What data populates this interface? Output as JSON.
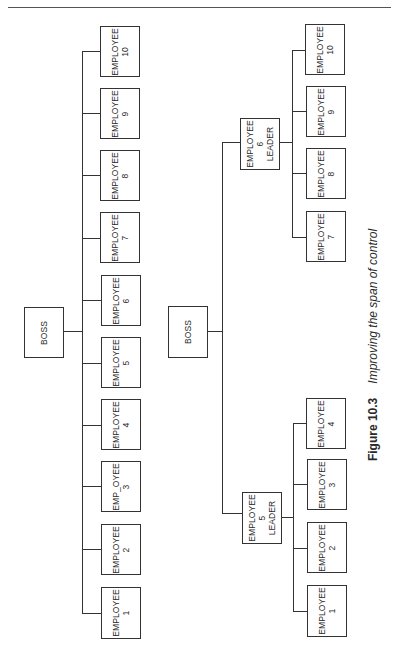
{
  "header": {
    "rule": true
  },
  "left_chart": {
    "name": "Flat structure",
    "boss": {
      "label": "BOSS"
    },
    "employees": [
      {
        "line1": "EMPLOYEE",
        "line2": "1"
      },
      {
        "line1": "EMPLOYEE",
        "line2": "2"
      },
      {
        "line1": "EMP_OYEE",
        "line2": "3"
      },
      {
        "line1": "EMPLOYEE",
        "line2": "4"
      },
      {
        "line1": "EMPLOYEE",
        "line2": "5"
      },
      {
        "line1": "EMPLOYEE",
        "line2": "6"
      },
      {
        "line1": "EMPLOYEE",
        "line2": "7"
      },
      {
        "line1": "EMPLOYEE",
        "line2": "8"
      },
      {
        "line1": "EMPLOYEE",
        "line2": "9"
      },
      {
        "line1": "EMPLOYEE",
        "line2": "10"
      }
    ]
  },
  "right_chart": {
    "name": "Structure with leaders",
    "boss": {
      "label": "BOSS"
    },
    "leaders": [
      {
        "line1": "EMPLOYEE",
        "line2": "5",
        "line3": "LEADER",
        "reports": [
          {
            "line1": "EMPLOYEE",
            "line2": "1"
          },
          {
            "line1": "EMPLOYEE",
            "line2": "2"
          },
          {
            "line1": "EMPLOYEE",
            "line2": "3"
          },
          {
            "line1": "EMPLOYEE",
            "line2": "4"
          }
        ]
      },
      {
        "line1": "EMPLOYEE",
        "line2": "6",
        "line3": "LEADER",
        "reports": [
          {
            "line1": "EMPLOYEE",
            "line2": "7"
          },
          {
            "line1": "EMPLOYEE",
            "line2": "8"
          },
          {
            "line1": "EMPLOYEE",
            "line2": "9"
          },
          {
            "line1": "EMPLOYEE",
            "line2": "10"
          }
        ]
      }
    ]
  },
  "caption": {
    "figure_label": "Figure 10.3",
    "title": "Improving the span of control"
  }
}
